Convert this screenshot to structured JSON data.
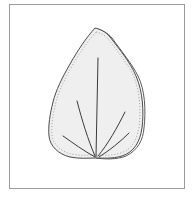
{
  "figure": {
    "colors": {
      "frame": "#9a9a9a",
      "leaf_fill": "#efefef",
      "outline": "#4a4a4a",
      "veins": "#3a3a3a",
      "margin_dots": "#8a8a8a"
    },
    "vein_count": 5
  }
}
